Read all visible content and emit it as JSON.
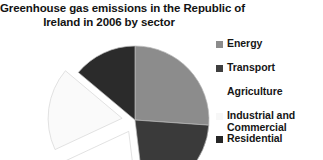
{
  "chart_data": {
    "type": "pie",
    "title": "Greenhouse gas emissions in the Republic of Ireland in 2006 by sector",
    "title_line_1": "Greenhouse gas emissions in the Republic of",
    "title_line_2": "Ireland in 2006 by sector",
    "xlabel": "",
    "ylabel": "",
    "legend_position": "right",
    "grid": false,
    "start_angle_deg": 0,
    "direction": "clockwise",
    "categories": [
      "Energy",
      "Transport",
      "Agriculture",
      "Industrial and Commercial",
      "Residential"
    ],
    "values": [
      26,
      22,
      20,
      18,
      14
    ],
    "colors": [
      "#8c8c8c",
      "#3a3a3a",
      "#ffffff",
      "#fafafa",
      "#2b2b2b"
    ],
    "exploded": [
      false,
      false,
      true,
      true,
      false
    ],
    "slices": [
      {
        "label": "Energy",
        "value": 26,
        "color": "#8c8c8c",
        "start_deg": 0,
        "end_deg": 94,
        "exploded": false
      },
      {
        "label": "Transport",
        "value": 22,
        "color": "#3a3a3a",
        "start_deg": 94,
        "end_deg": 173,
        "exploded": false
      },
      {
        "label": "Agriculture",
        "value": 20,
        "color": "#ffffff",
        "start_deg": 173,
        "end_deg": 245,
        "exploded": true
      },
      {
        "label": "Industrial and Commercial",
        "value": 18,
        "color": "#fafafa",
        "start_deg": 245,
        "end_deg": 310,
        "exploded": true
      },
      {
        "label": "Residential",
        "value": 14,
        "color": "#2b2b2b",
        "start_deg": 310,
        "end_deg": 360,
        "exploded": false
      }
    ]
  },
  "legend": {
    "items": [
      {
        "label": "Energy",
        "color": "#8c8c8c",
        "swatch_visible": true
      },
      {
        "label": "Transport",
        "color": "#3f3f3f",
        "swatch_visible": true
      },
      {
        "label": "Agriculture",
        "color": "#ffffff",
        "swatch_visible": false
      },
      {
        "label": "Industrial and",
        "label_line_2": "Commercial",
        "color": "#f7f7f7",
        "swatch_visible": false
      },
      {
        "label": "Residential",
        "color": "#262626",
        "swatch_visible": true
      }
    ]
  }
}
